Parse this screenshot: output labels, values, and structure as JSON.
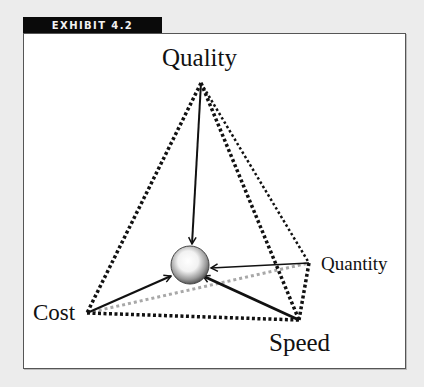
{
  "exhibit": {
    "label": "EXHIBIT 4.2"
  },
  "diagram": {
    "type": "pyramid",
    "center": "sphere",
    "nodes": [
      {
        "id": "quality",
        "label": "Quality",
        "x": 201,
        "y": 83
      },
      {
        "id": "cost",
        "label": "Cost",
        "x": 87,
        "y": 313
      },
      {
        "id": "speed",
        "label": "Speed",
        "x": 299,
        "y": 320
      },
      {
        "id": "quantity",
        "label": "Quantity",
        "x": 309,
        "y": 263
      }
    ],
    "edges": [
      {
        "from": "quality",
        "to": "cost",
        "style": "dotted"
      },
      {
        "from": "quality",
        "to": "speed",
        "style": "dotted"
      },
      {
        "from": "quality",
        "to": "quantity",
        "style": "dotted-thin"
      },
      {
        "from": "cost",
        "to": "speed",
        "style": "dotted"
      },
      {
        "from": "quantity",
        "to": "speed",
        "style": "dotted"
      },
      {
        "from": "cost",
        "to": "quantity",
        "style": "dotted-gray"
      }
    ],
    "arrows_to_center": [
      "quality",
      "cost",
      "speed",
      "quantity"
    ],
    "colors": {
      "line": "#111111",
      "hidden_edge": "#a8a8a8",
      "banner": "#0a0a0a",
      "background": "#ececec"
    }
  }
}
